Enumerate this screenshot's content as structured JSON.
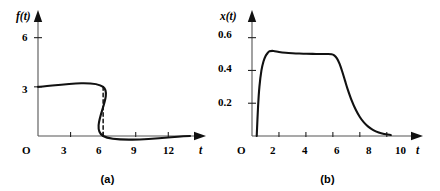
{
  "figure": {
    "panels": [
      {
        "caption": "(a)",
        "origin_label": "O",
        "y_axis_label": "f(t)",
        "x_axis_label": "t"
      },
      {
        "caption": "(b)",
        "origin_label": "O",
        "y_axis_label": "x(t)",
        "x_axis_label": "t"
      }
    ]
  },
  "chart_data": [
    {
      "type": "line",
      "panel": "(a)",
      "title": "",
      "xlabel": "t",
      "ylabel": "f(t)",
      "xlim": [
        0,
        14
      ],
      "ylim": [
        0,
        7.2
      ],
      "grid": false,
      "legend": "none",
      "x_ticks": [
        3,
        6,
        9,
        12
      ],
      "x_tick_labels": [
        "3",
        "6",
        "9",
        "12"
      ],
      "y_ticks": [
        3,
        6
      ],
      "y_tick_labels": [
        "3",
        "6"
      ],
      "origin_label": "O",
      "description": "Rectangular pulse: f(t) = 3 for 0 < t < 6, f(t) = 0 for t > 6",
      "series": [
        {
          "name": "f(t)",
          "style": "solid",
          "x": [
            0,
            6,
            6,
            14
          ],
          "values": [
            3,
            3,
            0,
            0
          ]
        },
        {
          "name": "discontinuity-marker",
          "style": "dashed",
          "x": [
            6,
            6
          ],
          "values": [
            3,
            0
          ]
        }
      ]
    },
    {
      "type": "line",
      "panel": "(b)",
      "title": "",
      "xlabel": "t",
      "ylabel": "x(t)",
      "xlim": [
        0,
        11.5
      ],
      "ylim": [
        0,
        0.72
      ],
      "grid": false,
      "legend": "none",
      "x_ticks": [
        2,
        4,
        6,
        8,
        10
      ],
      "x_tick_labels": [
        "2",
        "4",
        "6",
        "8",
        "10"
      ],
      "y_ticks": [
        0.2,
        0.4,
        0.6
      ],
      "y_tick_labels": [
        "0.2",
        "0.4",
        "0.6"
      ],
      "origin_label": "O",
      "description": "Step response: rapid rise to peak 0.52 near t=1.3, slight decay to plateau 0.50 through t=6, then exponential decay to 0 by t=9.5",
      "series": [
        {
          "name": "x(t)",
          "style": "solid",
          "x": [
            0.35,
            0.45,
            0.55,
            0.7,
            0.85,
            1.0,
            1.15,
            1.3,
            1.6,
            2.0,
            2.5,
            3.0,
            3.5,
            4.0,
            4.5,
            5.0,
            5.5,
            5.9,
            6.1,
            6.3,
            6.5,
            6.7,
            6.9,
            7.1,
            7.4,
            7.7,
            8.0,
            8.3,
            8.6,
            9.0,
            9.4,
            9.8,
            10.3
          ],
          "values": [
            0.0,
            0.18,
            0.3,
            0.4,
            0.455,
            0.487,
            0.505,
            0.517,
            0.519,
            0.513,
            0.508,
            0.505,
            0.503,
            0.502,
            0.501,
            0.5005,
            0.5,
            0.499,
            0.492,
            0.474,
            0.44,
            0.392,
            0.338,
            0.285,
            0.216,
            0.16,
            0.116,
            0.083,
            0.059,
            0.036,
            0.021,
            0.012,
            0.006
          ]
        }
      ]
    }
  ]
}
